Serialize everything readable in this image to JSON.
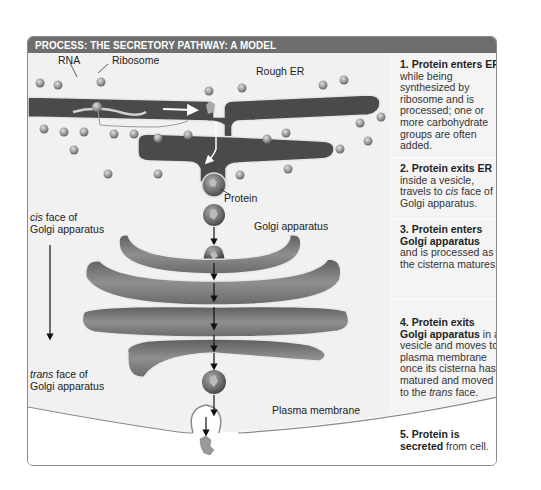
{
  "header": {
    "title": "PROCESS: THE SECRETORY PATHWAY: A MODEL"
  },
  "labels": {
    "rna": "RNA",
    "ribosome": "Ribosome",
    "rough_er": "Rough ER",
    "protein": "Protein",
    "cis_face_1": "cis",
    "cis_face_2": " face of",
    "cis_face_3": "Golgi apparatus",
    "golgi": "Golgi apparatus",
    "trans_face_1": "trans",
    "trans_face_2": " face of",
    "trans_face_3": "Golgi apparatus",
    "plasma_membrane": "Plasma membrane"
  },
  "steps": [
    {
      "bold": "1. Protein enters ER",
      "text": " while being synthesized by ribosome and is processed; one or more carbohydrate groups are often added."
    },
    {
      "bold": "2. Protein exits ER",
      "text_a": " inside a vesicle, travels to ",
      "italic": "cis",
      "text_b": " face of Golgi apparatus."
    },
    {
      "bold": "3. Protein enters Golgi apparatus",
      "text": " and is processed as the cisterna matures."
    },
    {
      "bold": "4. Protein exits Golgi apparatus",
      "text_a": " in a vesicle and moves to plasma membrane once its cisterna has matured and moved to the ",
      "italic": "trans",
      "text_b": " face."
    },
    {
      "bold": "5. Protein is secreted",
      "text": " from cell."
    }
  ],
  "colors": {
    "header_bg": "#6e6e6e",
    "panel_bg": "#f1f1f1",
    "er_lumen": "#4a4a4a",
    "golgi_fill": "#7d7d7d",
    "extracellular": "#ffffff"
  }
}
